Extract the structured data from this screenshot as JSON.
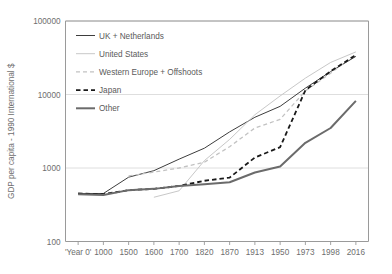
{
  "chart_data": {
    "type": "line",
    "title": "",
    "xlabel": "",
    "ylabel": "GDP per capita - 1990 International $",
    "yscale": "log",
    "ylim": [
      100,
      100000
    ],
    "ytick_labels": [
      "100000",
      "10000",
      "1000",
      "100"
    ],
    "ytick_values": [
      100000,
      10000,
      1000,
      100
    ],
    "grid": true,
    "grid_axis": "y",
    "legend_position": "upper-left-inside",
    "categories": [
      "'Year 0'",
      "1000",
      "1500",
      "1600",
      "1700",
      "1820",
      "1870",
      "1913",
      "1950",
      "1973",
      "1998",
      "2016"
    ],
    "series": [
      {
        "name": "UK + Netherlands",
        "color": "#3d3d3d",
        "style": "solid",
        "width": 1.0,
        "values": [
          450,
          450,
          750,
          920,
          1320,
          1860,
          3100,
          4900,
          6900,
          12200,
          20500,
          33000
        ]
      },
      {
        "name": "United States",
        "color": "#c8c8c8",
        "style": "solid",
        "width": 1.0,
        "values": [
          null,
          null,
          null,
          400,
          490,
          1260,
          2450,
          5300,
          9560,
          16700,
          27300,
          38000
        ]
      },
      {
        "name": "Western Europe + Offshoots",
        "color": "#c2c2c2",
        "style": "dashed",
        "width": 1.3,
        "values": [
          null,
          null,
          780,
          880,
          1000,
          1200,
          1950,
          3500,
          4600,
          11200,
          19500,
          35500
        ]
      },
      {
        "name": "Japan",
        "color": "#1a1a1a",
        "style": "dashed",
        "width": 1.8,
        "values": [
          450,
          440,
          500,
          520,
          570,
          670,
          740,
          1390,
          1920,
          11400,
          20700,
          34500
        ]
      },
      {
        "name": "Other",
        "color": "#6b6b6b",
        "style": "solid",
        "width": 2.0,
        "values": [
          440,
          430,
          500,
          520,
          570,
          600,
          640,
          870,
          1050,
          2200,
          3500,
          8200
        ]
      }
    ]
  },
  "legend": {
    "entries": [
      {
        "label": "UK + Netherlands"
      },
      {
        "label": "United States"
      },
      {
        "label": "Western Europe + Offshoots"
      },
      {
        "label": "Japan"
      },
      {
        "label": "Other"
      }
    ]
  }
}
